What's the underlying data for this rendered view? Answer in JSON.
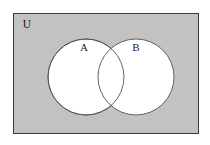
{
  "figure": {
    "kind": "venn-diagram",
    "title": "",
    "universe": {
      "label": "U",
      "fill_color": "#c2c2c2",
      "border_color": "#3c3c3c",
      "x": 13,
      "y": 13,
      "width": 186,
      "height": 121,
      "label_x": 27,
      "label_y": 25
    },
    "sets": [
      {
        "label": "A",
        "fill_color": "#ffffff",
        "stroke_color": "#555555",
        "cx": 86,
        "cy": 77,
        "r": 38,
        "label_x": 84,
        "label_y": 48
      },
      {
        "label": "B",
        "fill_color": "#ffffff",
        "stroke_color": "#555555",
        "cx": 136,
        "cy": 77,
        "r": 38,
        "label_x": 136,
        "label_y": 48
      }
    ],
    "background_color": "#ffffff"
  }
}
